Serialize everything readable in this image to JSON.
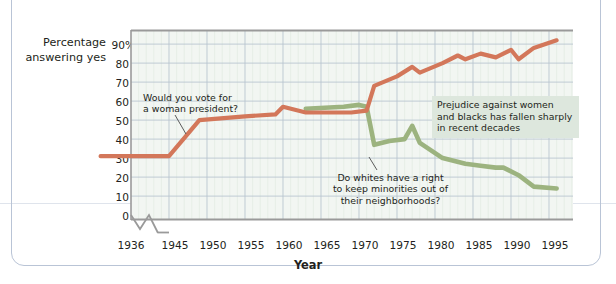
{
  "figure": {
    "y_axis_title": "Percentage\nanswering yes",
    "x_axis_title": "Year"
  },
  "annotations": {
    "women": "Would you vote for\na woman president?",
    "whites": "Do whites have a right\nto keep minorities out of\ntheir neighborhoods?",
    "callout": "Prejudice against women\nand blacks has fallen sharply\nin recent decades"
  },
  "colors": {
    "series_women": "#d3775a",
    "series_whites": "#9cb37f",
    "grid": "#b7c3cf",
    "plot_bg": "#f2f6f2",
    "axis": "#9a9a9a",
    "frame": "#b9c4d6",
    "callout_bg": "#dde7dd"
  },
  "chart_data": {
    "type": "line",
    "title": "",
    "xlabel": "Year",
    "ylabel": "Percentage answering yes",
    "xlim": [
      1936,
      1998
    ],
    "ylim": [
      0,
      95
    ],
    "grid": true,
    "legend": "none",
    "axis_break_x": true,
    "yticks": [
      "0",
      "10",
      "20",
      "30",
      "40",
      "50",
      "60",
      "70",
      "80",
      "90%"
    ],
    "ytick_values": [
      0,
      10,
      20,
      30,
      40,
      50,
      60,
      70,
      80,
      90
    ],
    "xticks": [
      "1936",
      "1945",
      "1950",
      "1955",
      "1960",
      "1965",
      "1970",
      "1975",
      "1980",
      "1985",
      "1990",
      "1995"
    ],
    "xtick_values": [
      1936,
      1945,
      1950,
      1955,
      1960,
      1965,
      1970,
      1975,
      1980,
      1985,
      1990,
      1995
    ],
    "series": [
      {
        "name": "Would you vote for a woman president?",
        "color": "#d3775a",
        "x": [
          1936,
          1945,
          1949,
          1955,
          1959,
          1960,
          1963,
          1967,
          1969,
          1971,
          1972,
          1975,
          1977,
          1978,
          1981,
          1983,
          1984,
          1986,
          1988,
          1990,
          1991,
          1993,
          1996
        ],
        "values": [
          31,
          31,
          50,
          52,
          53,
          57,
          54,
          54,
          54,
          55,
          68,
          73,
          78,
          75,
          80,
          84,
          82,
          85,
          83,
          87,
          82,
          88,
          92
        ]
      },
      {
        "name": "Do whites have a right to keep minorities out of their neighborhoods?",
        "color": "#9cb37f",
        "x": [
          1963,
          1968,
          1970,
          1971,
          1972,
          1974,
          1976,
          1977,
          1978,
          1981,
          1984,
          1986,
          1988,
          1989,
          1991,
          1993,
          1996
        ],
        "values": [
          56,
          57,
          58,
          57,
          37,
          39,
          40,
          47,
          38,
          30,
          27,
          26,
          25,
          25,
          21,
          15,
          14
        ]
      }
    ]
  }
}
